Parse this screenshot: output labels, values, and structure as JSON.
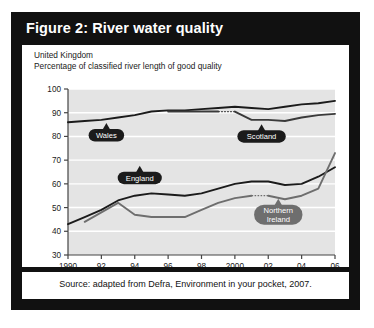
{
  "figure": {
    "title": "Figure 2: River water quality",
    "title_bar_color": "#111111",
    "panel_bg": "#ffffff"
  },
  "chart_header": {
    "line1": "United Kingdom",
    "line2": "Percentage of classified river length of good quality"
  },
  "source": {
    "text": "Source: adapted from Defra, Environment in your pocket, 2007."
  },
  "chart_data": {
    "type": "line",
    "title": "River water quality",
    "subtitle": "United Kingdom — Percentage of classified river length of good quality",
    "xlabel": "",
    "ylabel": "",
    "xlim": [
      1990,
      2006
    ],
    "ylim": [
      30,
      100
    ],
    "ytick_labels": [
      "100",
      "90",
      "80",
      "70",
      "60",
      "50",
      "40",
      "30"
    ],
    "yticks": [
      100,
      90,
      80,
      70,
      60,
      50,
      40,
      30
    ],
    "xtick_labels": [
      "1990",
      "92",
      "94",
      "96",
      "98",
      "2000",
      "02",
      "04",
      "06"
    ],
    "xticks": [
      1990,
      1992,
      1994,
      1996,
      1998,
      2000,
      2002,
      2004,
      2006
    ],
    "grid": "horizontal-white",
    "plot_bg": "#e4e4e4",
    "legend": "inline-callouts",
    "x": [
      1990,
      1991,
      1992,
      1993,
      1994,
      1995,
      1996,
      1997,
      1998,
      1999,
      2000,
      2001,
      2002,
      2003,
      2004,
      2005,
      2006
    ],
    "series": [
      {
        "name": "Wales",
        "color": "#1b1b1b",
        "label_style": "dark",
        "values": [
          86,
          86.5,
          87,
          88,
          89,
          90.5,
          91,
          91,
          91.5,
          92,
          92.5,
          92,
          91.5,
          92.5,
          93.5,
          94,
          95
        ]
      },
      {
        "name": "Scotland",
        "color": "#3a3a3a",
        "label_style": "dark",
        "break_at": 2000,
        "values": [
          null,
          null,
          null,
          null,
          null,
          null,
          90.5,
          90.5,
          90.5,
          90.5,
          90.5,
          87,
          87,
          86.5,
          88,
          89,
          89.5
        ]
      },
      {
        "name": "England",
        "color": "#1b1b1b",
        "label_style": "dark",
        "values": [
          43,
          46,
          49,
          53,
          55,
          56,
          55.5,
          55,
          56,
          58,
          60,
          61,
          61,
          59.5,
          60,
          63,
          67
        ]
      },
      {
        "name": "Northern Ireland",
        "color": "#6e6e6e",
        "label_style": "grey",
        "break_at": 2002,
        "values": [
          null,
          44,
          48,
          52,
          47,
          46,
          46,
          46,
          49,
          52,
          54,
          55,
          55,
          53.5,
          55,
          58,
          73
        ]
      }
    ],
    "callouts": [
      {
        "name": "Wales",
        "x": 1992.3,
        "y": 80.5,
        "style": "dark"
      },
      {
        "name": "Scotland",
        "x": 2001.6,
        "y": 80.0,
        "style": "dark"
      },
      {
        "name": "England",
        "x": 1994.3,
        "y": 62.5,
        "style": "dark"
      },
      {
        "name": "Northern Ireland",
        "x": 2002.6,
        "y": 47.0,
        "style": "grey"
      }
    ]
  }
}
